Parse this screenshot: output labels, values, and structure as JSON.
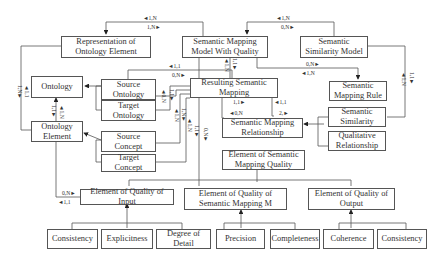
{
  "nodes": {
    "representation": "Representation of Ontology Element",
    "smmq": "Semantic Mapping Model With Quality",
    "ssm": "Semantic Similarity Model",
    "ontology": "Ontology",
    "source_ontology": "Source Ontology",
    "target_ontology": "Target Ontology",
    "resulting_sm": "Resulting Semantic Mapping",
    "sm_rule": "Semantic Mapping Rule",
    "ontology_element": "Ontology Element",
    "source_concept": "Source Concept",
    "target_concept": "Target Concept",
    "sm_relationship": "Semantic Mapping Relationship",
    "semantic_similarity": "Semantic Similarity",
    "qualitative_relationship": "Qualitative Relationship",
    "esmq": "Element of Semantic Mapping Quality",
    "eq_input": "Element of Quality of Input",
    "eq_smm": "Element of Quality of Semantic Mapping M",
    "eq_output": "Element of Quality of Output",
    "consistency_in": "Consistency",
    "explicitness": "Explicitness",
    "degree_of_detail": "Degree of Detail",
    "precision": "Precision",
    "completeness": "Completeness",
    "coherence": "Coherence",
    "consistency_out": "Consistency"
  },
  "labels": {
    "rep_smmq_top": "◄1,N",
    "rep_smmq_bot": "1,N►",
    "smmq_ssm_top": "◄1,N",
    "smmq_ssm_bot": "0,N►",
    "src_ont_top": "◄1,1",
    "src_ont_bot": "0,N►",
    "smmq_rule_top": "0,N►",
    "smmq_rule_bot": "◄1,N",
    "rsm_rel_left_top": "1,1►",
    "rsm_rel_left_bot": "◄0,N",
    "rsm_rel_right_top": "◄1,1",
    "rsm_rel_right_bot": "2,►",
    "input_oe_top": "0,N►",
    "input_oe_bot": "◄1,1",
    "v_rep_oe_a": "1,N►",
    "v_rep_oe_b": "◄1,1",
    "v_ont_oe_a": "1,1►",
    "v_ont_oe_b": "◄1,N",
    "v_tgt_ont_a": "◄0,N",
    "v_tgt_ont_b": "1,1►",
    "v_smmq_rsm_a": "◄1,N",
    "v_smmq_rsm_b": "1,1►",
    "v_concept_a": "◄1,N",
    "v_concept_b": "1,N►",
    "v_concept_c": "◄1,N",
    "v_concept_d": "1,1►",
    "v_smmq_down": "0,N►",
    "v_ssm_sim_a": "◄1,N",
    "v_ssm_sim_b": "1,1►"
  }
}
